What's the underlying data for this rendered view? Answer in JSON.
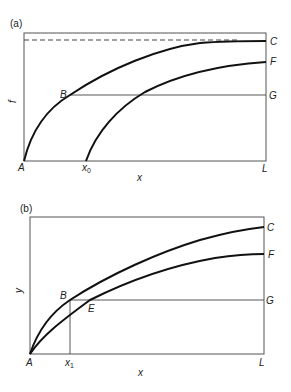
{
  "panel_a": {
    "label": "(a)",
    "y_axis_label": "f",
    "x_axis_label": "x",
    "points": {
      "A": "A",
      "B": "B",
      "C": "C",
      "F": "F",
      "G": "G",
      "L": "L"
    },
    "x0_main": "x",
    "x0_sub": "0"
  },
  "panel_b": {
    "label": "(b)",
    "y_axis_label": "y",
    "x_axis_label": "x",
    "points": {
      "A": "A",
      "B": "B",
      "C": "C",
      "E": "E",
      "F": "F",
      "G": "G",
      "L": "L"
    },
    "x1_main": "x",
    "x1_sub": "1"
  }
}
